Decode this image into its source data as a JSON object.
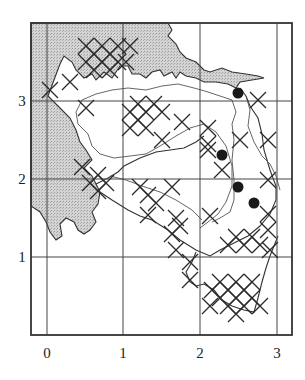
{
  "map": {
    "title": "",
    "x_axis": {
      "ticks": [
        {
          "label": "0",
          "px": 47
        },
        {
          "label": "1",
          "px": 123
        },
        {
          "label": "2",
          "px": 200
        },
        {
          "label": "3",
          "px": 277
        }
      ]
    },
    "y_axis": {
      "ticks": [
        {
          "label": "3",
          "px": 101
        },
        {
          "label": "2",
          "px": 179
        },
        {
          "label": "1",
          "px": 257
        }
      ]
    },
    "frame": {
      "left": 31,
      "top": 23,
      "right": 292,
      "bottom": 335
    },
    "colors": {
      "land_shade": "#c9c9c9",
      "ink": "#2a2a2a",
      "river": "#555555",
      "background": "#ffffff"
    },
    "legend": {
      "cross_symbol": "recorded square (cross)",
      "dot_symbol": "record (filled circle)"
    },
    "dots": [
      {
        "x": 238,
        "y": 93
      },
      {
        "x": 222,
        "y": 155
      },
      {
        "x": 238,
        "y": 187
      },
      {
        "x": 254,
        "y": 203
      }
    ],
    "crosses": [
      [
        86,
        62
      ],
      [
        94,
        54
      ],
      [
        102,
        62
      ],
      [
        110,
        54
      ],
      [
        118,
        62
      ],
      [
        102,
        46
      ],
      [
        86,
        46
      ],
      [
        118,
        46
      ],
      [
        130,
        46
      ],
      [
        94,
        70
      ],
      [
        110,
        70
      ],
      [
        126,
        62
      ],
      [
        50,
        90
      ],
      [
        86,
        108
      ],
      [
        70,
        82
      ],
      [
        130,
        112
      ],
      [
        138,
        120
      ],
      [
        146,
        128
      ],
      [
        130,
        128
      ],
      [
        138,
        104
      ],
      [
        154,
        104
      ],
      [
        162,
        112
      ],
      [
        146,
        112
      ],
      [
        162,
        140
      ],
      [
        208,
        128
      ],
      [
        208,
        144
      ],
      [
        240,
        140
      ],
      [
        268,
        140
      ],
      [
        182,
        122
      ],
      [
        98,
        175
      ],
      [
        90,
        183
      ],
      [
        82,
        167
      ],
      [
        98,
        191
      ],
      [
        106,
        183
      ],
      [
        140,
        187
      ],
      [
        148,
        195
      ],
      [
        156,
        203
      ],
      [
        172,
        187
      ],
      [
        148,
        215
      ],
      [
        176,
        218
      ],
      [
        172,
        234
      ],
      [
        180,
        226
      ],
      [
        176,
        250
      ],
      [
        208,
        150
      ],
      [
        222,
        170
      ],
      [
        258,
        100
      ],
      [
        268,
        180
      ],
      [
        210,
        216
      ],
      [
        228,
        245
      ],
      [
        244,
        245
      ],
      [
        260,
        245
      ],
      [
        236,
        237
      ],
      [
        252,
        237
      ],
      [
        268,
        230
      ],
      [
        268,
        214
      ],
      [
        270,
        250
      ],
      [
        190,
        280
      ],
      [
        190,
        262
      ],
      [
        212,
        290
      ],
      [
        220,
        298
      ],
      [
        228,
        290
      ],
      [
        236,
        298
      ],
      [
        244,
        290
      ],
      [
        252,
        298
      ],
      [
        228,
        306
      ],
      [
        244,
        306
      ],
      [
        236,
        282
      ],
      [
        252,
        282
      ],
      [
        220,
        282
      ],
      [
        236,
        314
      ],
      [
        260,
        306
      ],
      [
        210,
        306
      ]
    ]
  }
}
